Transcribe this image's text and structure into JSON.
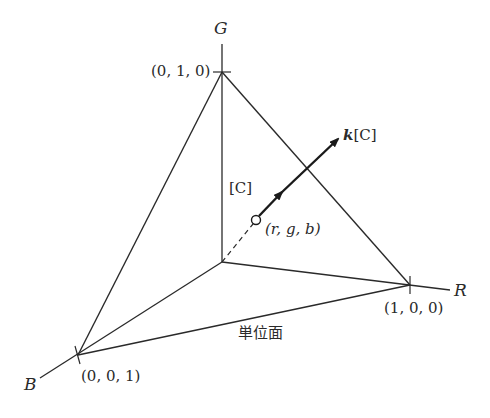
{
  "diagram": {
    "type": "rgb-color-space-unit-plane",
    "axes": {
      "G": {
        "label": "G"
      },
      "R": {
        "label": "R"
      },
      "B": {
        "label": "B"
      }
    },
    "vertices": {
      "g_unit": {
        "label": "(0, 1, 0)"
      },
      "r_unit": {
        "label": "(1, 0, 0)"
      },
      "b_unit": {
        "label": "(0, 0, 1)"
      }
    },
    "point": {
      "label": "(r, g, b)"
    },
    "vector_labels": {
      "unit_color": "[C]",
      "scaled_prefix": "k",
      "scaled_color": "[C]"
    },
    "plane_label": "単位面",
    "colors": {
      "line": "#2a2a2a",
      "background": "#ffffff"
    }
  }
}
